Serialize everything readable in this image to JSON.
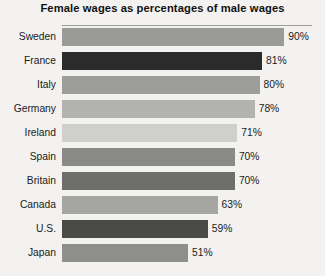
{
  "chart_data": {
    "type": "bar",
    "orientation": "horizontal",
    "title": "Female wages as percentages of male wages",
    "xlabel": "",
    "ylabel": "",
    "xlim": [
      0,
      100
    ],
    "grid": false,
    "legend": null,
    "value_suffix": "%",
    "categories": [
      "Sweden",
      "France",
      "Italy",
      "Germany",
      "Ireland",
      "Spain",
      "Britain",
      "Canada",
      "U.S.",
      "Japan"
    ],
    "values": [
      90,
      81,
      80,
      78,
      71,
      70,
      70,
      63,
      59,
      51
    ],
    "value_labels": [
      "90%",
      "81%",
      "80%",
      "78%",
      "71%",
      "70%",
      "70%",
      "63%",
      "59%",
      "51%"
    ],
    "bar_colors": [
      "#9a9a98",
      "#2b2b2b",
      "#9d9d9b",
      "#b2b2b0",
      "#cfcfcd",
      "#8a8a88",
      "#6e6e6c",
      "#a5a5a3",
      "#4a4a48",
      "#8e8e8c"
    ],
    "background_color": "#f3f2f0",
    "rule_color": "#9a9a98"
  }
}
